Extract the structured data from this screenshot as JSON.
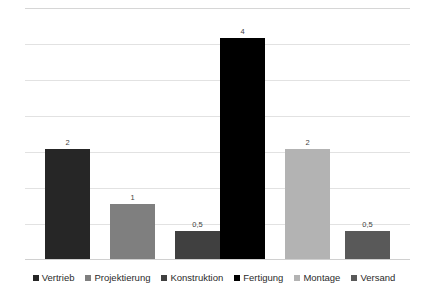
{
  "chart_data": {
    "type": "bar",
    "title": "",
    "subtitle": "",
    "xlabel": "",
    "ylabel": "",
    "ylim": [
      0,
      4.55
    ],
    "grid": true,
    "gridline_count": 8,
    "legend_position": "bottom",
    "categories": [
      "Vertrieb",
      "Projektierung",
      "Konstruktion",
      "Fertigung",
      "Montage",
      "Versand"
    ],
    "values": [
      2,
      1,
      0.5,
      4,
      2,
      0.5
    ],
    "value_labels": [
      "2",
      "1",
      "0,5",
      "4",
      "2",
      "0,5"
    ],
    "colors": [
      "#262626",
      "#7f7f7f",
      "#404040",
      "#000000",
      "#b3b3b3",
      "#595959"
    ],
    "tick_labels": [],
    "series": [
      {
        "name": "",
        "values": [
          2,
          1,
          0.5,
          4,
          2,
          0.5
        ]
      }
    ],
    "bars": [
      {
        "category": "Vertrieb",
        "value": 2,
        "label": "2",
        "color": "#262626"
      },
      {
        "category": "Projektierung",
        "value": 1,
        "label": "1",
        "color": "#7f7f7f"
      },
      {
        "category": "Konstruktion",
        "value": 0.5,
        "label": "0,5",
        "color": "#404040"
      },
      {
        "category": "Fertigung",
        "value": 4,
        "label": "4",
        "color": "#000000"
      },
      {
        "category": "Montage",
        "value": 2,
        "label": "2",
        "color": "#b3b3b3"
      },
      {
        "category": "Versand",
        "value": 0.5,
        "label": "0,5",
        "color": "#595959"
      }
    ]
  },
  "legend": {
    "items": [
      {
        "label": "Vertrieb",
        "color": "#262626"
      },
      {
        "label": "Projektierung",
        "color": "#7f7f7f"
      },
      {
        "label": "Konstruktion",
        "color": "#404040"
      },
      {
        "label": "Fertigung",
        "color": "#000000"
      },
      {
        "label": "Montage",
        "color": "#b3b3b3"
      },
      {
        "label": "Versand",
        "color": "#595959"
      }
    ]
  }
}
